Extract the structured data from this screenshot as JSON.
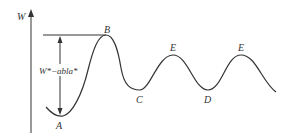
{
  "diagram": {
    "type": "potential-energy-curve",
    "axis": {
      "label": "W"
    },
    "interval_label": "W*−abla*",
    "points": [
      {
        "id": "A",
        "label": "A",
        "kind": "minimum"
      },
      {
        "id": "B",
        "label": "B",
        "kind": "maximum"
      },
      {
        "id": "C",
        "label": "C",
        "kind": "minimum"
      },
      {
        "id": "E1",
        "label": "E",
        "kind": "maximum"
      },
      {
        "id": "D",
        "label": "D",
        "kind": "minimum"
      },
      {
        "id": "E2",
        "label": "E",
        "kind": "maximum"
      }
    ],
    "colors": {
      "stroke": "#333333",
      "background": "#ffffff"
    }
  }
}
